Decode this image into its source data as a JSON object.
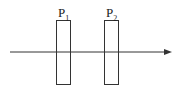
{
  "diagram": {
    "type": "optics",
    "polarizers": [
      {
        "label": "P",
        "subscript": "1"
      },
      {
        "label": "P",
        "subscript": "2"
      }
    ],
    "ray": {
      "direction": "left-to-right"
    },
    "stroke_color": "#333333"
  }
}
